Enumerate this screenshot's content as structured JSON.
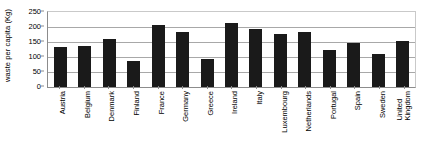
{
  "chart_data": {
    "type": "bar",
    "title": "",
    "xlabel": "",
    "ylabel": "waste per capita (Kg)",
    "ylim": [
      0,
      250
    ],
    "yticks": [
      0,
      50,
      100,
      150,
      200,
      250
    ],
    "grid": true,
    "legend": "none",
    "categories": [
      "Austria",
      "Belgium",
      "Denmark",
      "Finland",
      "France",
      "Germany",
      "Greece",
      "Ireland",
      "Italy",
      "Luxembourg",
      "Netherlands",
      "Portugal",
      "Spain",
      "Sweden",
      "United Kingdom"
    ],
    "values": [
      135,
      138,
      160,
      88,
      208,
      182,
      92,
      213,
      195,
      178,
      184,
      124,
      146,
      111,
      152
    ],
    "bar_color": "#1a1a1a",
    "axis_color": "#8c8c8c",
    "grid_color": "#a8a8a8",
    "background": "#ffffff"
  }
}
